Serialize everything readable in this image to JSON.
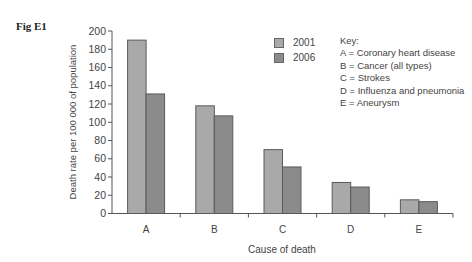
{
  "figure": {
    "label": "Fig E1"
  },
  "colors": {
    "series_2001": "#a9a9a9",
    "series_2006": "#8b8b8b",
    "outline": "#5a5a5a",
    "axis": "#555555"
  },
  "legend": {
    "items": [
      {
        "label": "2001",
        "color": "#a9a9a9"
      },
      {
        "label": "2006",
        "color": "#8b8b8b"
      }
    ]
  },
  "key": {
    "title": "Key:",
    "entries": [
      "A = Coronary heart disease",
      "B = Cancer (all types)",
      "C = Strokes",
      "D = Influenza and pneumonia",
      "E = Aneurysm"
    ]
  },
  "chart_data": {
    "type": "bar",
    "title": "Fig E1",
    "categories": [
      "A",
      "B",
      "C",
      "D",
      "E"
    ],
    "series": [
      {
        "name": "2001",
        "values": [
          190,
          118,
          70,
          34,
          15
        ]
      },
      {
        "name": "2006",
        "values": [
          131,
          107,
          51,
          29,
          13
        ]
      }
    ],
    "xlabel": "Cause of death",
    "ylabel": "Death rate per 100 000 of population",
    "ylim": [
      0,
      200
    ],
    "yticks": [
      0,
      20,
      40,
      60,
      80,
      100,
      120,
      140,
      160,
      180,
      200
    ],
    "grid": false,
    "legend_position": "upper right",
    "category_key": {
      "A": "Coronary heart disease",
      "B": "Cancer (all types)",
      "C": "Strokes",
      "D": "Influenza and pneumonia",
      "E": "Aneurysm"
    }
  }
}
